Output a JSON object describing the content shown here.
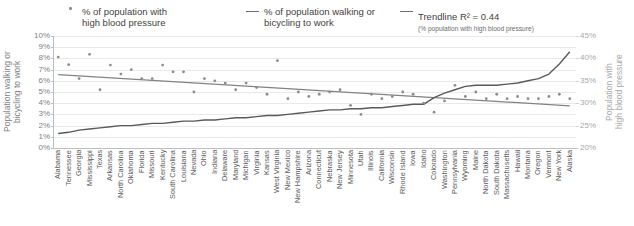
{
  "legend": {
    "bp": {
      "label": "% of population with\nhigh blood pressure",
      "marker": "scatter-dot-marker"
    },
    "walk": {
      "label": "% of population walking or\nbicycling to work",
      "marker": "line-marker"
    },
    "trend": {
      "label": "Trendline R² = 0.44",
      "sublabel": "(% population with high blood pressure)",
      "marker": "line-marker"
    }
  },
  "axes": {
    "left_title": "Population walking or\nbicycling to work",
    "right_title": "Population with\nhigh blood pressure",
    "left_ticks": [
      "10%",
      "9%",
      "8%",
      "7%",
      "6%",
      "5%",
      "4%",
      "3%",
      "2%",
      "1%",
      "0%"
    ],
    "right_ticks": [
      "45%",
      "40%",
      "35%",
      "30%",
      "25%",
      "20%"
    ]
  },
  "colors": {
    "scatter": "#8c8c8c",
    "walk_line": "#595a5c",
    "trend_line": "#808285",
    "grid": "#e9e9ea",
    "axis": "#bcbec0",
    "text": "#58595b",
    "right_axis_text": "#a7a9ac"
  },
  "chart_data": {
    "type": "scatter",
    "title": "",
    "xlabel": "",
    "ylabel": "Population walking or bicycling to work",
    "y2label": "Population with high blood pressure",
    "ylim": [
      0,
      10
    ],
    "y2lim": [
      20,
      45
    ],
    "grid": true,
    "legend_position": "top",
    "categories": [
      "Alabama",
      "Tennessee",
      "Georgia",
      "Mississippi",
      "Texas",
      "Arkansas",
      "North Carolina",
      "Oklahoma",
      "Florida",
      "Missouri",
      "Kentucky",
      "South Carolina",
      "Louisiana",
      "Nevada",
      "Ohio",
      "Indiana",
      "Delaware",
      "Maryland",
      "Michigan",
      "Virginia",
      "Kansas",
      "West Virginia",
      "New Mexico",
      "New Hampshire",
      "Arizona",
      "Connecticut",
      "Nebraska",
      "New Jersey",
      "Minnesota",
      "Utah",
      "Illinois",
      "California",
      "Wisconsin",
      "Rhode Island",
      "Iowa",
      "Idaho",
      "Colorado",
      "Washington",
      "Pennsylvania",
      "Wyoming",
      "Maine",
      "North Dakota",
      "South Dakota",
      "Massachusetts",
      "Hawaii",
      "Montana",
      "Oregon",
      "Vermont",
      "New York",
      "Alaska"
    ],
    "series": [
      {
        "name": "% of population with high blood pressure",
        "axis": "right",
        "type": "scatter",
        "values": [
          40.3,
          38.6,
          35.5,
          40.9,
          33.0,
          38.5,
          36.5,
          37.5,
          35.5,
          35.5,
          38.5,
          37.0,
          37.0,
          32.5,
          35.5,
          35.0,
          34.5,
          33.0,
          34.5,
          33.5,
          32.0,
          39.5,
          31.0,
          32.5,
          31.5,
          32.0,
          32.5,
          33.0,
          29.5,
          27.5,
          32.0,
          31.0,
          31.5,
          32.5,
          32.0,
          30.0,
          28.0,
          30.5,
          34.0,
          31.5,
          32.5,
          31.0,
          32.0,
          31.0,
          31.5,
          31.0,
          31.0,
          31.5,
          32.0,
          31.0
        ]
      },
      {
        "name": "% of population walking or bicycling to work",
        "axis": "left",
        "type": "line",
        "values": [
          1.3,
          1.4,
          1.6,
          1.7,
          1.8,
          1.9,
          2.0,
          2.0,
          2.1,
          2.2,
          2.2,
          2.3,
          2.4,
          2.4,
          2.5,
          2.5,
          2.6,
          2.7,
          2.7,
          2.8,
          2.9,
          2.9,
          3.0,
          3.1,
          3.2,
          3.3,
          3.4,
          3.4,
          3.5,
          3.5,
          3.6,
          3.6,
          3.7,
          3.8,
          3.9,
          3.9,
          4.5,
          4.9,
          5.2,
          5.5,
          5.6,
          5.6,
          5.6,
          5.7,
          5.8,
          6.0,
          6.2,
          6.6,
          7.5,
          8.6
        ]
      },
      {
        "name": "Trendline R² = 0.44",
        "axis": "right",
        "type": "trendline",
        "r_squared": 0.44,
        "endpoints": [
          36.4,
          29.4
        ]
      }
    ]
  }
}
